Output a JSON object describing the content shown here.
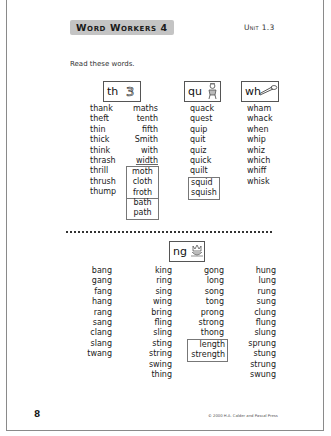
{
  "header": {
    "title": "Word Workers 4",
    "unit": "Unit 1.3"
  },
  "instruction": "Read these words.",
  "top_section": {
    "th": {
      "label": "th",
      "icon": "numeral-three-icon",
      "icon_glyph": "3",
      "col1": [
        "thank",
        "theft",
        "thin",
        "thick",
        "think",
        "thrash",
        "thrill",
        "thrush",
        "thump"
      ],
      "col2": [
        "maths",
        "tenth",
        "fifth",
        "Smith",
        "with",
        "width"
      ],
      "col2_boxed_a": [
        "moth",
        "cloth",
        "froth"
      ],
      "col2_boxed_b": [
        "bath",
        "path"
      ]
    },
    "qu": {
      "label": "qu",
      "icon": "queen-icon",
      "words": [
        "quack",
        "quest",
        "quip",
        "quit",
        "quiz",
        "quick",
        "quilt"
      ],
      "boxed": [
        "squid",
        "squish"
      ]
    },
    "wh": {
      "label": "wh",
      "icon": "whistle-icon",
      "words": [
        "wham",
        "whack",
        "when",
        "whip",
        "whiz",
        "which",
        "whiff",
        "whisk"
      ]
    }
  },
  "bottom_section": {
    "ng": {
      "label": "ng",
      "icon": "king-crown-icon",
      "col1": [
        "bang",
        "gang",
        "fang",
        "hang",
        "rang",
        "sang",
        "clang",
        "slang",
        "twang"
      ],
      "col2": [
        "king",
        "ring",
        "sing",
        "wing",
        "bring",
        "fling",
        "sling",
        "sting",
        "string",
        "swing",
        "thing"
      ],
      "col3": [
        "gong",
        "long",
        "song",
        "tong",
        "prong",
        "strong",
        "thong"
      ],
      "col3_boxed": [
        "length",
        "strength"
      ],
      "col4": [
        "hung",
        "lung",
        "rung",
        "sung",
        "clung",
        "flung",
        "slung",
        "sprung",
        "stung",
        "strung",
        "swung"
      ]
    }
  },
  "footer": {
    "page_number": "8",
    "copyright": "© 2000 H.A. Calder and Pascal Press"
  }
}
